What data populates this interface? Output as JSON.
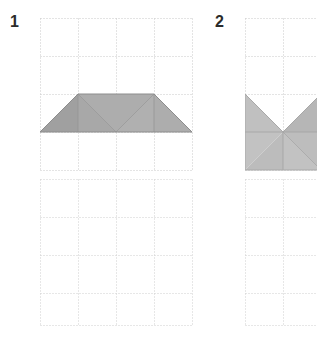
{
  "page": {
    "background_color": "#ffffff",
    "width": 317,
    "height": 350
  },
  "style": {
    "grid_line_color": "#c9c9c9",
    "grid_line_dash": "1,2",
    "grid_cell_size": 38,
    "shape_fill_dark": "#a0a0a0",
    "shape_fill_mid": "#ababab",
    "shape_fill_light": "#b8b8b8",
    "shape_fill_pale": "#c6c6c6",
    "shape_stroke": "#8d8d8d",
    "number_color": "#2b2b2b"
  },
  "exercises": [
    {
      "id": "exercise-1",
      "number": "1",
      "top_panel": {
        "name": "figure-grid-1",
        "x": 40,
        "y": 18,
        "cols": 4,
        "rows": 4,
        "cell": 38,
        "has_shape": true,
        "shape_name": "trapezoid-with-fold-lines",
        "shape_description": "Isosceles trapezoid: long base along row 3, short top along row 2 spanning columns 1 to 3, with internal diagonal fold lines",
        "outline_points": "0,114 38,76 114,76 152,114",
        "facets": [
          {
            "name": "facet-left-triangle",
            "points": "0,114 38,76 38,114",
            "fill": "#a0a0a0"
          },
          {
            "name": "facet-inner-triangle",
            "points": "38,76 76,114 38,114",
            "fill": "#a8a8a8"
          },
          {
            "name": "facet-center-upper",
            "points": "38,76 114,76 76,114",
            "fill": "#adadad"
          },
          {
            "name": "facet-center-lower",
            "points": "76,114 114,76 114,114",
            "fill": "#b0b0b0"
          },
          {
            "name": "facet-right-triangle",
            "points": "114,76 152,114 114,114",
            "fill": "#adadad"
          }
        ],
        "fold_lines": [
          "38,76 76,114",
          "38,76 38,114",
          "114,76 114,114",
          "76,114 114,76",
          "0,114 152,114"
        ]
      },
      "bottom_panel": {
        "name": "answer-grid-1",
        "x": 40,
        "y": 179,
        "cols": 4,
        "rows": 4,
        "cell": 38,
        "has_shape": false
      }
    },
    {
      "id": "exercise-2",
      "number": "2",
      "top_panel": {
        "name": "figure-grid-2",
        "x": 40,
        "y": 18,
        "cols": 4,
        "rows": 4,
        "cell": 38,
        "clipped_right": true,
        "has_shape": true,
        "shape_name": "square-with-v-notch",
        "shape_description": "Square spanning rows 3-4 and columns 1-4 with a V-shaped notch cut from its top edge meeting at the centre point, plus a diagonal fold line to the lower right corner",
        "outline_points": "0,76 38,114 76,76 76,152 0,152",
        "facets": [
          {
            "name": "facet-left-wedge",
            "points": "0,76 38,114 0,114",
            "fill": "#c0c0c0"
          },
          {
            "name": "facet-right-wedge",
            "points": "38,114 76,76 76,114",
            "fill": "#b6b6b6"
          },
          {
            "name": "facet-lower-left",
            "points": "0,114 38,114 0,152",
            "fill": "#c2c2c2"
          },
          {
            "name": "facet-lower-left-inner",
            "points": "38,114 38,152 0,152",
            "fill": "#bcbcbc"
          },
          {
            "name": "facet-lower-right-upper",
            "points": "38,114 76,114 76,152",
            "fill": "#bdbdbd"
          },
          {
            "name": "facet-lower-right-lower",
            "points": "38,114 76,152 38,152",
            "fill": "#c2c2c2"
          }
        ],
        "fold_lines": [
          "0,114 76,114",
          "38,114 76,152",
          "38,114 38,152"
        ]
      },
      "bottom_panel": {
        "name": "answer-grid-2",
        "x": 40,
        "y": 179,
        "cols": 4,
        "rows": 4,
        "cell": 38,
        "clipped_right": true,
        "has_shape": false
      }
    }
  ]
}
